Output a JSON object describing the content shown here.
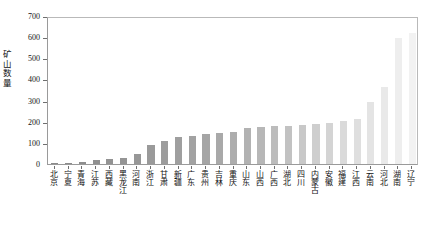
{
  "chart_data": {
    "type": "bar",
    "title": "",
    "xlabel": "",
    "ylabel": "矿山数量",
    "ylim": [
      0,
      700
    ],
    "yticks": [
      0,
      100,
      200,
      300,
      400,
      500,
      600,
      700
    ],
    "ytick_labels": [
      "0",
      "100",
      "200",
      "300",
      "400",
      "500",
      "600",
      "700"
    ],
    "grid": false,
    "legend": "none",
    "categories": [
      "北京",
      "宁夏",
      "青海",
      "江苏",
      "西藏",
      "黑龙江",
      "河南",
      "浙江",
      "甘肃",
      "新疆",
      "广东",
      "贵州",
      "吉林",
      "重庆",
      "山东",
      "山西",
      "广西",
      "湖北",
      "四川",
      "内蒙古",
      "安徽",
      "福建",
      "江西",
      "云南",
      "河北",
      "湖南",
      "辽宁"
    ],
    "values": [
      3,
      5,
      10,
      18,
      22,
      28,
      46,
      92,
      108,
      128,
      133,
      140,
      148,
      152,
      168,
      173,
      178,
      182,
      186,
      190,
      196,
      205,
      212,
      295,
      365,
      595,
      620
    ],
    "bar_colors": [
      "#8a8a8a",
      "#8c8c8c",
      "#8e8e8e",
      "#909090",
      "#939393",
      "#959595",
      "#979797",
      "#9a9a9a",
      "#9c9c9c",
      "#9f9f9f",
      "#a2a2a2",
      "#a5a5a5",
      "#a9a9a9",
      "#adadad",
      "#b2b2b2",
      "#b7b7b7",
      "#bcbcbc",
      "#c2c2c2",
      "#c8c8c8",
      "#cecece",
      "#d4d4d4",
      "#dadada",
      "#dfdfdf",
      "#e4e4e4",
      "#e9e9e9",
      "#eeeeee",
      "#f2f2f2"
    ],
    "axis_color": "#8f8f8f",
    "text_color": "#111111"
  }
}
